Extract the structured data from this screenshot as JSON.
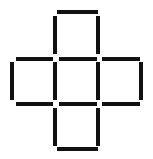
{
  "figure": {
    "canvas": {
      "width": 153,
      "height": 159,
      "background": "#ffffff"
    },
    "stroke_color": "#111111",
    "stroke_thickness": 4,
    "square_count": 5,
    "segment_count": 16,
    "grid": {
      "x_lines": [
        12,
        55,
        98,
        141
      ],
      "y_lines": [
        11,
        58,
        103,
        148
      ],
      "cell_width": 43,
      "cell_height": 45
    },
    "segments": [
      {
        "name": "top-square-top-edge",
        "orientation": "h",
        "x": 57,
        "y": 10,
        "length": 41
      },
      {
        "name": "top-square-left-edge",
        "orientation": "v",
        "x": 53,
        "y": 16,
        "length": 38
      },
      {
        "name": "top-square-right-edge",
        "orientation": "v",
        "x": 96,
        "y": 16,
        "length": 38
      },
      {
        "name": "upper-row-left-edge",
        "orientation": "h",
        "x": 16,
        "y": 57,
        "length": 37
      },
      {
        "name": "upper-row-center-edge",
        "orientation": "h",
        "x": 59,
        "y": 57,
        "length": 38
      },
      {
        "name": "upper-row-right-edge",
        "orientation": "h",
        "x": 102,
        "y": 57,
        "length": 38
      },
      {
        "name": "left-square-left-edge",
        "orientation": "v",
        "x": 10,
        "y": 62,
        "length": 38
      },
      {
        "name": "middle-left-vertical-edge",
        "orientation": "v",
        "x": 53,
        "y": 62,
        "length": 38
      },
      {
        "name": "middle-right-vertical-edge",
        "orientation": "v",
        "x": 96,
        "y": 62,
        "length": 38
      },
      {
        "name": "right-square-right-edge",
        "orientation": "v",
        "x": 139,
        "y": 62,
        "length": 38
      },
      {
        "name": "lower-row-left-edge",
        "orientation": "h",
        "x": 16,
        "y": 102,
        "length": 37
      },
      {
        "name": "lower-row-center-edge",
        "orientation": "h",
        "x": 59,
        "y": 102,
        "length": 38
      },
      {
        "name": "lower-row-right-edge",
        "orientation": "h",
        "x": 102,
        "y": 102,
        "length": 38
      },
      {
        "name": "bottom-square-left-edge",
        "orientation": "v",
        "x": 53,
        "y": 108,
        "length": 38
      },
      {
        "name": "bottom-square-right-edge",
        "orientation": "v",
        "x": 96,
        "y": 108,
        "length": 38
      },
      {
        "name": "bottom-square-bottom-edge",
        "orientation": "h",
        "x": 57,
        "y": 147,
        "length": 41
      }
    ]
  }
}
